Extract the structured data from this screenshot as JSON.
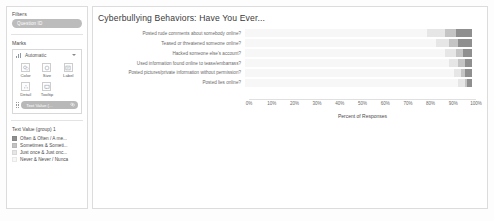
{
  "sidebar": {
    "filters": {
      "title": "Filters",
      "pill_label": "Question ID"
    },
    "marks": {
      "title": "Marks",
      "mark_type": "Automatic",
      "shelves": [
        {
          "name": "color",
          "label": "Color",
          "icon": "color-icon"
        },
        {
          "name": "size",
          "label": "Size",
          "icon": "size-icon"
        },
        {
          "name": "label",
          "label": "Label",
          "icon": "label-icon"
        },
        {
          "name": "detail",
          "label": "Detail",
          "icon": "detail-icon"
        },
        {
          "name": "tooltip",
          "label": "Tooltip",
          "icon": "tooltip-icon"
        }
      ],
      "field_pill": "Text Value (..."
    },
    "legend": {
      "title": "Text Value (group) 1",
      "items": [
        {
          "label": "Often & Often / A me...",
          "color": "#8f8f8f"
        },
        {
          "label": "Sometimes & Someti...",
          "color": "#c4c4c4"
        },
        {
          "label": "Just once & Just onc...",
          "color": "#e6e6e6"
        },
        {
          "label": "Never & Never / Nunca",
          "color": "#f7f7f7"
        }
      ]
    }
  },
  "chart_data": {
    "type": "bar",
    "title": "Cyberbullying Behaviors: Have You Ever...",
    "xlabel": "Percent of Responses",
    "ylabel": "",
    "xlim": [
      0,
      100
    ],
    "grid": false,
    "legend_position": "left-sidebar",
    "stacked": true,
    "orientation": "horizontal",
    "xticks": [
      "0%",
      "10%",
      "20%",
      "30%",
      "40%",
      "50%",
      "60%",
      "70%",
      "80%",
      "90%",
      "100%"
    ],
    "categories": [
      "Posted rude comments about somebody online?",
      "Teased or threatened someone online?",
      "Hacked someone else's account?",
      "Used information found online to tease/embarrass?",
      "Posted pictures/private information without permission?",
      "Posted lies online?"
    ],
    "series": [
      {
        "name": "Never & Never / Nunca",
        "color": "#f7f7f7",
        "values": [
          80,
          84,
          88,
          90,
          92,
          94
        ]
      },
      {
        "name": "Just once & Just onc...",
        "color": "#e6e6e6",
        "values": [
          8,
          6,
          5,
          4,
          3,
          3
        ]
      },
      {
        "name": "Sometimes & Someti...",
        "color": "#c4c4c4",
        "values": [
          5,
          4,
          3,
          3,
          2,
          1
        ]
      },
      {
        "name": "Often & Often / A me...",
        "color": "#8f8f8f",
        "values": [
          7,
          6,
          4,
          3,
          3,
          2
        ]
      }
    ]
  }
}
